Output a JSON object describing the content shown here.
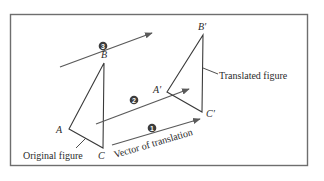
{
  "diagram": {
    "frame": {
      "x": 10,
      "y": 14,
      "width": 298,
      "height": 152,
      "stroke": "#6e6e6e"
    },
    "colors": {
      "line": "#3a3a3a",
      "arrow": "#5a5a5a",
      "text": "#2b2b2b",
      "badge": "#3c3c3c",
      "background": "#ffffff"
    },
    "original_figure": {
      "label": "Original figure",
      "vertices": [
        {
          "name": "A",
          "x": 69,
          "y": 129
        },
        {
          "name": "B",
          "x": 104,
          "y": 63
        },
        {
          "name": "C",
          "x": 103,
          "y": 148
        }
      ]
    },
    "translated_figure": {
      "label": "Translated figure",
      "vertices": [
        {
          "name": "A′",
          "x": 167,
          "y": 92
        },
        {
          "name": "B′",
          "x": 203,
          "y": 35
        },
        {
          "name": "C′",
          "x": 202,
          "y": 112
        }
      ]
    },
    "vectors": [
      {
        "id": 1,
        "badge": "1",
        "label": "Vector of translation",
        "from": [
          112,
          145
        ],
        "to": [
          200,
          119
        ]
      },
      {
        "id": 2,
        "badge": "2",
        "from": [
          96,
          124
        ],
        "to": [
          189,
          89
        ]
      },
      {
        "id": 3,
        "badge": "3",
        "from": [
          60,
          67
        ],
        "to": [
          152,
          33
        ]
      }
    ]
  }
}
